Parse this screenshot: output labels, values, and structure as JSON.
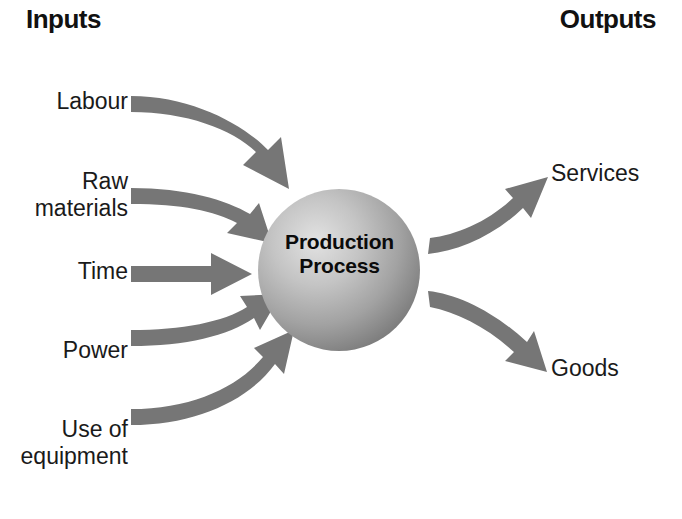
{
  "diagram": {
    "title_left": "Inputs",
    "title_right": "Outputs",
    "center_node": {
      "line1": "Production",
      "line2": "Process",
      "shape": "sphere",
      "fill_light": "#d9d9d9",
      "fill_dark": "#8a8a8a"
    },
    "arrow_color": "#767676",
    "inputs": [
      {
        "label": "Labour",
        "arrow": "curve-down-steep"
      },
      {
        "label": "Raw",
        "label2": "materials",
        "arrow": "curve-down-shallow"
      },
      {
        "label": "Time",
        "arrow": "straight"
      },
      {
        "label": "Power",
        "arrow": "curve-up-shallow"
      },
      {
        "label": "Use of",
        "label2": "equipment",
        "arrow": "curve-up-steep"
      }
    ],
    "outputs": [
      {
        "label": "Services",
        "arrow": "curve-up-right"
      },
      {
        "label": "Goods",
        "arrow": "curve-down-right"
      }
    ]
  }
}
